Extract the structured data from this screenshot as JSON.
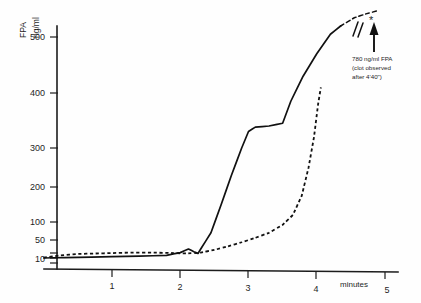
{
  "chart_data": {
    "type": "line",
    "title": "",
    "subtitle": "",
    "xlabel": "minutes",
    "ylabel": "FPA ng/ml",
    "ylabel_parts": [
      "FPA",
      "ng/ml"
    ],
    "xlim": [
      0,
      5
    ],
    "ylim": [
      0,
      550
    ],
    "grid": false,
    "legend": "none",
    "y_axis_note": "non-linear compressed scale below 100",
    "xticks": [
      1,
      2,
      3,
      4,
      5
    ],
    "xtick_labels": [
      "1",
      "2",
      "3",
      "4",
      "5"
    ],
    "yticks": [
      10,
      50,
      100,
      200,
      300,
      400,
      500
    ],
    "ytick_labels": [
      "10",
      "50",
      "100",
      "200",
      "300",
      "400",
      "500"
    ],
    "series": [
      {
        "name": "solid-curve",
        "style": "solid",
        "x": [
          0.0,
          0.3,
          0.7,
          1.0,
          1.4,
          1.8,
          2.0,
          2.12,
          2.2,
          2.26,
          2.3,
          2.45,
          2.6,
          2.75,
          2.9,
          3.0,
          3.1,
          3.3,
          3.5,
          3.62,
          3.8,
          4.0,
          4.2,
          4.35
        ],
        "y": [
          10,
          11,
          12,
          13,
          14,
          16,
          22,
          30,
          24,
          20,
          30,
          70,
          150,
          230,
          300,
          330,
          338,
          340,
          345,
          385,
          430,
          470,
          505,
          520
        ]
      },
      {
        "name": "dashed-curve",
        "style": "dashed",
        "x": [
          0.0,
          0.25,
          0.5,
          0.75,
          1.0,
          1.3,
          1.6,
          1.9,
          2.1,
          2.3,
          2.5,
          2.7,
          2.9,
          3.1,
          3.3,
          3.5,
          3.65,
          3.78,
          3.88,
          3.96,
          4.02,
          4.06
        ],
        "y": [
          11,
          16,
          19,
          20,
          21,
          22,
          22,
          21,
          20,
          22,
          28,
          36,
          45,
          56,
          70,
          92,
          120,
          175,
          250,
          320,
          380,
          410
        ]
      }
    ],
    "tail_segment": {
      "name": "solid-curve-extension",
      "style": "dashed",
      "description": "dashed continuation of solid curve beyond plot with axis break",
      "x": [
        4.35,
        4.55,
        4.72,
        4.9
      ],
      "y": [
        520,
        535,
        542,
        548
      ]
    },
    "annotations": [
      {
        "name": "break-mark",
        "symbol": "//",
        "description": "axis break on curve extension"
      },
      {
        "name": "asterisk-marker",
        "symbol": "*"
      },
      {
        "name": "clot-annotation",
        "lines": [
          "780 ng/ml FPA",
          "(clot observed",
          "after 4'40\")"
        ],
        "arrow": "up-arrow"
      }
    ],
    "colors": {
      "curve": "#111111",
      "axis": "#1c1c1c",
      "background": "#ffffff",
      "text": "#1f1f1f"
    }
  }
}
